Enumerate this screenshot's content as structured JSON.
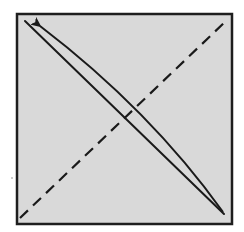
{
  "diagram": {
    "type": "origami-fold-instruction",
    "canvas": {
      "width": 244,
      "height": 232,
      "background": "#ffffff"
    },
    "paper_square": {
      "x": 17,
      "y": 14,
      "width": 215,
      "height": 210,
      "fill": "#d9d9d9",
      "stroke": "#1e1e1e",
      "stroke_width": 2.5
    },
    "fold_line_solid": {
      "description": "existing crease, top-left to bottom-right",
      "x1": 25,
      "y1": 21,
      "x2": 224,
      "y2": 214,
      "stroke": "#1a1a1a",
      "stroke_width": 2
    },
    "fold_line_dashed": {
      "description": "valley fold line, bottom-left to top-right",
      "x1": 20,
      "y1": 218,
      "x2": 226,
      "y2": 21,
      "stroke": "#1a1a1a",
      "stroke_width": 2.2,
      "dash": "11 7"
    },
    "fold_arrow": {
      "description": "curved arrow indicating fold from bottom-right corner to top-left corner",
      "path": "M 223 212 Q 150 110 40 26",
      "stroke": "#1a1a1a",
      "stroke_width": 2,
      "arrowhead_tip": {
        "x": 36,
        "y": 23
      }
    },
    "stray_mark": {
      "x": 12,
      "y": 178,
      "r": 0.8,
      "fill": "#888888"
    }
  }
}
